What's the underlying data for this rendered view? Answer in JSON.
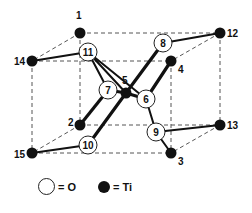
{
  "diagram": {
    "colors": {
      "ti": "#111111",
      "o_fill": "#ffffff",
      "stroke": "#222222",
      "dash": "#555555"
    },
    "ti_atoms": [
      {
        "id": "1",
        "x": 80,
        "y": 33,
        "lx": 76,
        "ly": 19
      },
      {
        "id": "12",
        "x": 220,
        "y": 33,
        "lx": 227,
        "ly": 37
      },
      {
        "id": "14",
        "x": 32,
        "y": 61,
        "lx": 14,
        "ly": 65
      },
      {
        "id": "4",
        "x": 171,
        "y": 61,
        "lx": 178,
        "ly": 73
      },
      {
        "id": "5",
        "x": 126,
        "y": 93,
        "lx": 122,
        "ly": 84
      },
      {
        "id": "2",
        "x": 80,
        "y": 125,
        "lx": 68,
        "ly": 126
      },
      {
        "id": "13",
        "x": 220,
        "y": 125,
        "lx": 227,
        "ly": 129
      },
      {
        "id": "15",
        "x": 32,
        "y": 153,
        "lx": 14,
        "ly": 158
      },
      {
        "id": "3",
        "x": 171,
        "y": 153,
        "lx": 178,
        "ly": 165
      }
    ],
    "o_atoms": [
      {
        "id": "11",
        "x": 88,
        "y": 52
      },
      {
        "id": "8",
        "x": 163,
        "y": 43
      },
      {
        "id": "7",
        "x": 108,
        "y": 90
      },
      {
        "id": "6",
        "x": 146,
        "y": 99
      },
      {
        "id": "10",
        "x": 88,
        "y": 145
      },
      {
        "id": "9",
        "x": 156,
        "y": 132
      }
    ],
    "bonds": [
      [
        "14",
        "11"
      ],
      [
        "12",
        "8"
      ],
      [
        "15",
        "10"
      ],
      [
        "13",
        "9"
      ],
      [
        "5",
        "8"
      ],
      [
        "5",
        "10"
      ],
      [
        "11",
        "6"
      ],
      [
        "11",
        "5"
      ],
      [
        "5",
        "7"
      ],
      [
        "5",
        "6"
      ],
      [
        "2",
        "7"
      ],
      [
        "4",
        "6"
      ],
      [
        "6",
        "9"
      ],
      [
        "9",
        "3"
      ],
      [
        "11",
        "7"
      ]
    ],
    "dashed_edges": [
      [
        "1",
        "12"
      ],
      [
        "14",
        "4"
      ],
      [
        "2",
        "13"
      ],
      [
        "15",
        "3"
      ],
      [
        "1",
        "14"
      ],
      [
        "12",
        "4"
      ],
      [
        "2",
        "15"
      ],
      [
        "13",
        "3"
      ],
      [
        "1",
        "2"
      ],
      [
        "12",
        "13"
      ],
      [
        "14",
        "15"
      ],
      [
        "4",
        "3"
      ]
    ]
  },
  "legend": {
    "o_label": "= O",
    "ti_label": "= Ti"
  }
}
